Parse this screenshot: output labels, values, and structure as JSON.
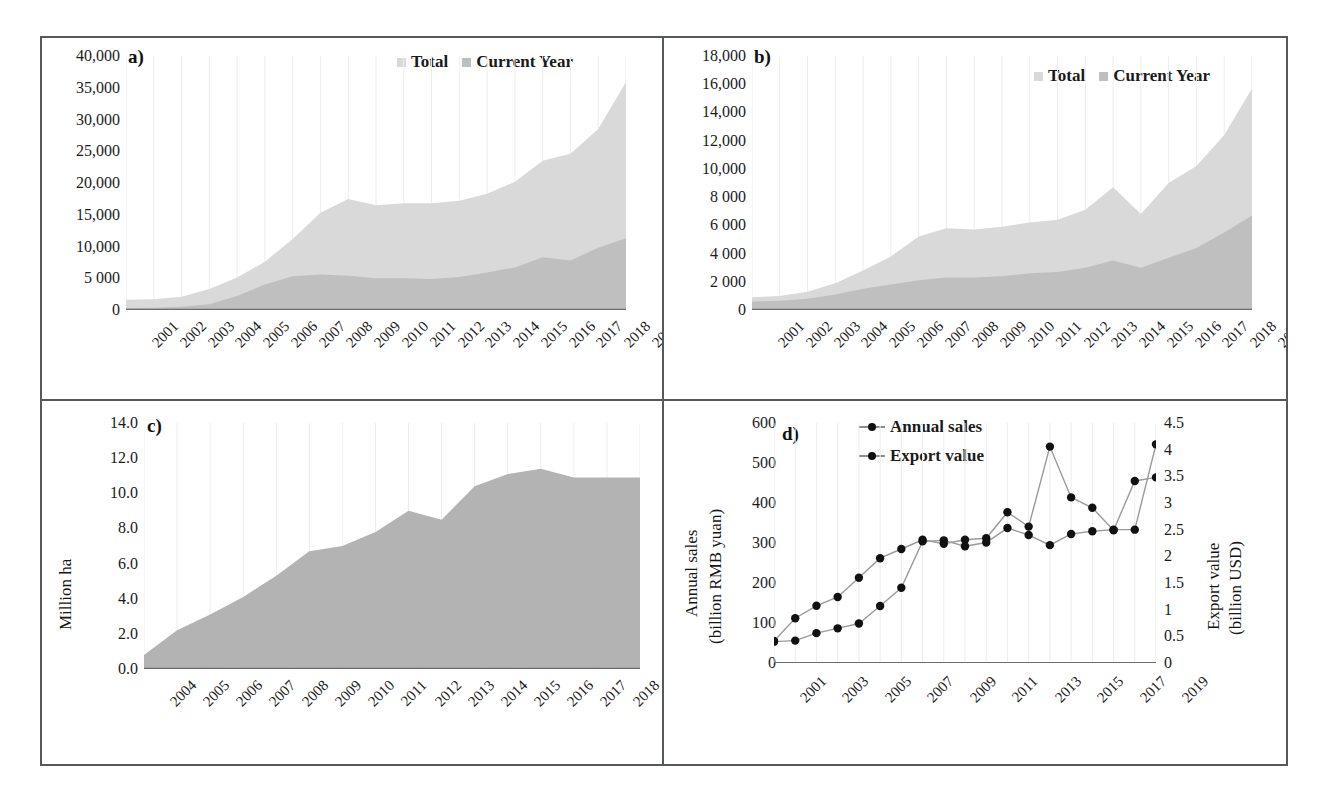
{
  "figure": {
    "panels": [
      "a)",
      "b)",
      "c)",
      "d)"
    ]
  },
  "panel_a": {
    "tag": "a)",
    "legend": [
      {
        "label": "Total",
        "color": "#d9d9d9"
      },
      {
        "label": "Current Year",
        "color": "#bfbfbf"
      }
    ],
    "yticks": [
      "0",
      "5 000",
      "10,000",
      "15,000",
      "20,000",
      "25,000",
      "30,000",
      "35,000",
      "40,000"
    ],
    "xticks": [
      "2001",
      "2002",
      "2003",
      "2004",
      "2005",
      "2006",
      "2007",
      "2008",
      "2009",
      "2010",
      "2011",
      "2012",
      "2013",
      "2014",
      "2015",
      "2016",
      "2017",
      "2018",
      "2019"
    ]
  },
  "panel_b": {
    "tag": "b)",
    "legend": [
      {
        "label": "Total",
        "color": "#d9d9d9"
      },
      {
        "label": "Current Year",
        "color": "#bfbfbf"
      }
    ],
    "yticks": [
      "0",
      "2 000",
      "4 000",
      "6 000",
      "8 000",
      "10,000",
      "12,000",
      "14,000",
      "16,000",
      "18,000"
    ],
    "xticks": [
      "2001",
      "2002",
      "2003",
      "2004",
      "2005",
      "2006",
      "2007",
      "2008",
      "2009",
      "2010",
      "2011",
      "2012",
      "2013",
      "2014",
      "2015",
      "2016",
      "2017",
      "2018",
      "2019"
    ]
  },
  "panel_c": {
    "tag": "c)",
    "ylabel": "Million ha",
    "yticks": [
      "0.0",
      "2.0",
      "4.0",
      "6.0",
      "8.0",
      "10.0",
      "12.0",
      "14.0"
    ],
    "xticks": [
      "2004",
      "2005",
      "2006",
      "2007",
      "2008",
      "2009",
      "2010",
      "2011",
      "2012",
      "2013",
      "2014",
      "2015",
      "2016",
      "2017",
      "2018",
      "2019"
    ]
  },
  "panel_d": {
    "tag": "d)",
    "ylabel_left_line1": "Annual sales",
    "ylabel_left_line2": "(billion RMB yuan)",
    "ylabel_right_line1": "Export value",
    "ylabel_right_line2": "(billion USD)",
    "yticks_left": [
      "0",
      "100",
      "200",
      "300",
      "400",
      "500",
      "600"
    ],
    "yticks_right": [
      "0",
      "0.5",
      "1",
      "1.5",
      "2",
      "2.5",
      "3",
      "3.5",
      "4",
      "4.5"
    ],
    "xticks": [
      "2001",
      "2003",
      "2005",
      "2007",
      "2009",
      "2011",
      "2013",
      "2015",
      "2017",
      "2019"
    ],
    "legend": [
      {
        "label": "Annual sales",
        "marker": "line-dot"
      },
      {
        "label": "Export value",
        "marker": "line-dot"
      }
    ]
  },
  "chart_data": [
    {
      "type": "area",
      "panel": "a",
      "title": "",
      "xlabel": "",
      "ylabel": "",
      "ylim": [
        0,
        40000
      ],
      "ytick_values": [
        0,
        5000,
        10000,
        15000,
        20000,
        25000,
        30000,
        35000,
        40000
      ],
      "grid": false,
      "legend_position": "top-right",
      "x": [
        2001,
        2002,
        2003,
        2004,
        2005,
        2006,
        2007,
        2008,
        2009,
        2010,
        2011,
        2012,
        2013,
        2014,
        2015,
        2016,
        2017,
        2018,
        2019
      ],
      "series": [
        {
          "name": "Total",
          "color": "#d9d9d9",
          "values": [
            1600,
            1700,
            2100,
            3300,
            5100,
            7600,
            11200,
            15300,
            17500,
            16500,
            16800,
            16800,
            17200,
            18300,
            20200,
            23500,
            24600,
            28500,
            35900
          ]
        },
        {
          "name": "Current Year",
          "color": "#bfbfbf",
          "values": [
            300,
            350,
            500,
            900,
            2200,
            4000,
            5300,
            5600,
            5400,
            5000,
            5000,
            4900,
            5200,
            5900,
            6700,
            8300,
            7800,
            9800,
            11300
          ]
        }
      ]
    },
    {
      "type": "area",
      "panel": "b",
      "title": "",
      "xlabel": "",
      "ylabel": "",
      "ylim": [
        0,
        18000
      ],
      "ytick_values": [
        0,
        2000,
        4000,
        6000,
        8000,
        10000,
        12000,
        14000,
        16000,
        18000
      ],
      "grid": false,
      "legend_position": "top-right",
      "x": [
        2001,
        2002,
        2003,
        2004,
        2005,
        2006,
        2007,
        2008,
        2009,
        2010,
        2011,
        2012,
        2013,
        2014,
        2015,
        2016,
        2017,
        2018,
        2019
      ],
      "series": [
        {
          "name": "Total",
          "color": "#d9d9d9",
          "values": [
            900,
            1000,
            1300,
            1900,
            2800,
            3800,
            5200,
            5800,
            5700,
            5900,
            6200,
            6400,
            7100,
            8700,
            6800,
            9000,
            10200,
            12400,
            15700
          ]
        },
        {
          "name": "Current Year",
          "color": "#bfbfbf",
          "values": [
            600,
            650,
            800,
            1100,
            1500,
            1800,
            2100,
            2300,
            2300,
            2400,
            2600,
            2700,
            3000,
            3500,
            3000,
            3700,
            4400,
            5500,
            6700
          ]
        }
      ]
    },
    {
      "type": "area",
      "panel": "c",
      "title": "",
      "xlabel": "",
      "ylabel": "Million ha",
      "ylim": [
        0,
        14.0
      ],
      "ytick_values": [
        0.0,
        2.0,
        4.0,
        6.0,
        8.0,
        10.0,
        12.0,
        14.0
      ],
      "grid": false,
      "x": [
        2004,
        2005,
        2006,
        2007,
        2008,
        2009,
        2010,
        2011,
        2012,
        2013,
        2014,
        2015,
        2016,
        2017,
        2018,
        2019
      ],
      "series": [
        {
          "name": "Area",
          "color": "#b3b3b3",
          "values": [
            0.8,
            2.2,
            3.1,
            4.1,
            5.3,
            6.7,
            7.0,
            7.8,
            9.0,
            8.5,
            10.4,
            11.1,
            11.4,
            10.9,
            10.9,
            10.9
          ]
        }
      ]
    },
    {
      "type": "line",
      "panel": "d",
      "title": "",
      "xlabel": "",
      "ylabel": "Annual sales (billion RMB yuan)",
      "ylabel_secondary": "Export value (billion USD)",
      "ylim": [
        0,
        600
      ],
      "ylim_secondary": [
        0,
        4.5
      ],
      "ytick_values": [
        0,
        100,
        200,
        300,
        400,
        500,
        600
      ],
      "ytick_values_secondary": [
        0,
        0.5,
        1,
        1.5,
        2,
        2.5,
        3,
        3.5,
        4,
        4.5
      ],
      "grid": false,
      "legend_position": "top-center",
      "x": [
        2001,
        2002,
        2003,
        2004,
        2005,
        2006,
        2007,
        2008,
        2009,
        2010,
        2011,
        2012,
        2013,
        2014,
        2015,
        2016,
        2017,
        2018,
        2019
      ],
      "series": [
        {
          "name": "Annual sales",
          "axis": "left",
          "marker": "circle",
          "values": [
            55,
            112,
            143,
            165,
            213,
            262,
            285,
            308,
            298,
            308,
            312,
            377,
            341,
            541,
            414,
            388,
            332,
            455,
            464
          ]
        },
        {
          "name": "Export value",
          "axis": "right",
          "marker": "circle",
          "values": [
            0.4,
            0.42,
            0.56,
            0.65,
            0.74,
            1.07,
            1.41,
            2.28,
            2.3,
            2.19,
            2.26,
            2.53,
            2.4,
            2.21,
            2.42,
            2.47,
            2.5,
            2.5,
            4.1
          ]
        }
      ]
    }
  ]
}
